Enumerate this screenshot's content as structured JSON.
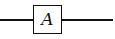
{
  "diagram": {
    "type": "block-diagram",
    "blocks": [
      {
        "label": "A"
      }
    ],
    "connections": [
      {
        "from": "input",
        "to": "A"
      },
      {
        "from": "A",
        "to": "output"
      }
    ]
  },
  "colors": {
    "stroke": "#111111",
    "background": "#ffffff"
  }
}
